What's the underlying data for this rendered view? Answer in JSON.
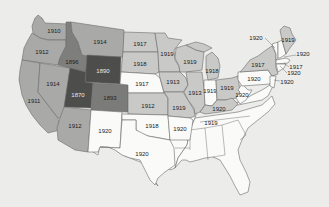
{
  "colors": {
    "background": "#ececeb",
    "y1920": "#fafaf9",
    "y1917_1919": "#c9c9c8",
    "y1910_1914": "#a9a9a8",
    "y1896": "#7e7e7d",
    "y1893": "#7b7b7a",
    "y1870_1890": "#4d4d4c"
  },
  "map": {
    "title": "",
    "states": [
      {
        "id": "WA",
        "year": "1910"
      },
      {
        "id": "OR",
        "year": "1912"
      },
      {
        "id": "CA",
        "year": "1911"
      },
      {
        "id": "NV",
        "year": "1914"
      },
      {
        "id": "ID",
        "year": "1896"
      },
      {
        "id": "MT",
        "year": "1914"
      },
      {
        "id": "WY",
        "year": "1890"
      },
      {
        "id": "UT",
        "year": "1870"
      },
      {
        "id": "CO",
        "year": "1893"
      },
      {
        "id": "AZ",
        "year": "1912"
      },
      {
        "id": "NM",
        "year": "1920"
      },
      {
        "id": "ND",
        "year": "1917"
      },
      {
        "id": "SD",
        "year": "1918"
      },
      {
        "id": "NE",
        "year": "1917"
      },
      {
        "id": "KS",
        "year": "1912"
      },
      {
        "id": "OK",
        "year": "1918"
      },
      {
        "id": "TX",
        "year": "1920"
      },
      {
        "id": "MN",
        "year": "1919"
      },
      {
        "id": "IA",
        "year": "1913"
      },
      {
        "id": "MO",
        "year": "1919"
      },
      {
        "id": "AR",
        "year": "1920"
      },
      {
        "id": "WI",
        "year": "1919"
      },
      {
        "id": "IL",
        "year": "1913"
      },
      {
        "id": "IN",
        "year": "1919"
      },
      {
        "id": "MI",
        "year": "1918"
      },
      {
        "id": "OH",
        "year": "1919"
      },
      {
        "id": "KY",
        "year": "1920"
      },
      {
        "id": "TN",
        "year": "1919"
      },
      {
        "id": "WV",
        "year": "1920"
      },
      {
        "id": "PA",
        "year": "1920"
      },
      {
        "id": "NY",
        "year": "1917"
      },
      {
        "id": "ME",
        "year": "1919"
      },
      {
        "id": "VT",
        "year": "1920"
      },
      {
        "id": "NH",
        "year": "1920"
      },
      {
        "id": "MA",
        "year": "1920"
      },
      {
        "id": "RI",
        "year": "1917"
      },
      {
        "id": "CT",
        "year": "1920"
      },
      {
        "id": "NJ",
        "year": "1920"
      }
    ]
  }
}
